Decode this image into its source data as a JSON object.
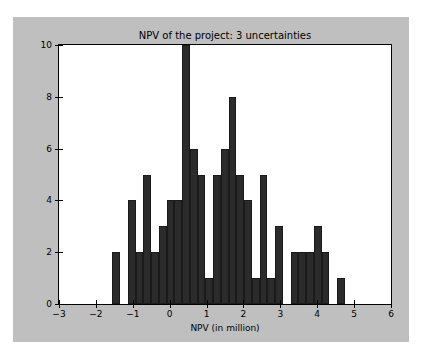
{
  "chart_data": {
    "type": "bar",
    "title": "NPV of the project: 3 uncertainties",
    "xlabel": "NPV (in million)",
    "ylabel": "",
    "xlim": [
      -3,
      6
    ],
    "ylim": [
      0,
      10
    ],
    "grid": false,
    "legend": null,
    "xticks": [
      -3,
      -2,
      -1,
      0,
      1,
      2,
      3,
      4,
      5,
      6
    ],
    "xtick_labels": [
      "−3",
      "−2",
      "−1",
      "0",
      "1",
      "2",
      "3",
      "4",
      "5",
      "6"
    ],
    "yticks": [
      0,
      2,
      4,
      6,
      8,
      10
    ],
    "ytick_labels": [
      "0",
      "2",
      "4",
      "6",
      "8",
      "10"
    ],
    "bin_width": 0.21,
    "bar_color": "#2b2b2b",
    "facecolor": "#ffffff",
    "figure_color": "#bfbfbf",
    "bins": [
      {
        "x0": -1.55,
        "x1": -1.34,
        "count": 2
      },
      {
        "x0": -1.34,
        "x1": -1.13,
        "count": 0
      },
      {
        "x0": -1.13,
        "x1": -0.92,
        "count": 4
      },
      {
        "x0": -0.92,
        "x1": -0.71,
        "count": 2
      },
      {
        "x0": -0.71,
        "x1": -0.5,
        "count": 5
      },
      {
        "x0": -0.5,
        "x1": -0.29,
        "count": 2
      },
      {
        "x0": -0.29,
        "x1": -0.08,
        "count": 3
      },
      {
        "x0": -0.08,
        "x1": 0.13,
        "count": 4
      },
      {
        "x0": 0.13,
        "x1": 0.34,
        "count": 4
      },
      {
        "x0": 0.34,
        "x1": 0.55,
        "count": 10
      },
      {
        "x0": 0.55,
        "x1": 0.76,
        "count": 6
      },
      {
        "x0": 0.76,
        "x1": 0.97,
        "count": 5
      },
      {
        "x0": 0.97,
        "x1": 1.18,
        "count": 1
      },
      {
        "x0": 1.18,
        "x1": 1.39,
        "count": 5
      },
      {
        "x0": 1.39,
        "x1": 1.6,
        "count": 6
      },
      {
        "x0": 1.6,
        "x1": 1.81,
        "count": 8
      },
      {
        "x0": 1.81,
        "x1": 2.02,
        "count": 5
      },
      {
        "x0": 2.02,
        "x1": 2.23,
        "count": 4
      },
      {
        "x0": 2.23,
        "x1": 2.44,
        "count": 1
      },
      {
        "x0": 2.44,
        "x1": 2.65,
        "count": 5
      },
      {
        "x0": 2.65,
        "x1": 2.86,
        "count": 1
      },
      {
        "x0": 2.86,
        "x1": 3.07,
        "count": 3
      },
      {
        "x0": 3.07,
        "x1": 3.28,
        "count": 0
      },
      {
        "x0": 3.28,
        "x1": 3.49,
        "count": 2
      },
      {
        "x0": 3.49,
        "x1": 3.7,
        "count": 2
      },
      {
        "x0": 3.7,
        "x1": 3.91,
        "count": 2
      },
      {
        "x0": 3.91,
        "x1": 4.12,
        "count": 3
      },
      {
        "x0": 4.12,
        "x1": 4.33,
        "count": 2
      },
      {
        "x0": 4.33,
        "x1": 4.54,
        "count": 0
      },
      {
        "x0": 4.54,
        "x1": 4.75,
        "count": 1
      },
      {
        "x0": 4.75,
        "x1": 7.1,
        "count": 0
      },
      {
        "x0": 7.1,
        "x1": 7.31,
        "count": 1
      }
    ]
  }
}
